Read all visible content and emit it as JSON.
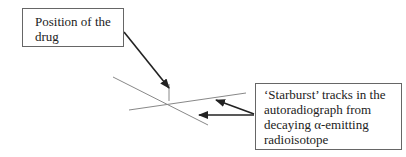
{
  "labels": {
    "drug_position": [
      "Position of the",
      "drug"
    ],
    "tracks": [
      "‘Starburst’ tracks in the",
      "autoradiograph from",
      "decaying α-emitting",
      "radioisotope"
    ]
  },
  "colors": {
    "track_line": "#888888",
    "arrow": "#222222",
    "box_border": "#666666"
  }
}
